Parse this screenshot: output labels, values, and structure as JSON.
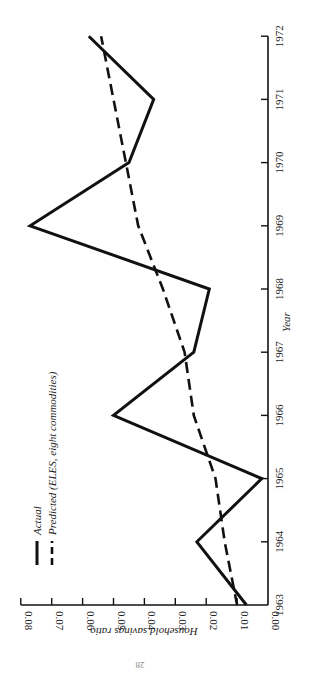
{
  "chart_data": {
    "type": "line",
    "title": "",
    "xlabel": "Year",
    "ylabel": "Household savings ratio",
    "orientation": "rotated 90° counter-clockwise (years run bottom-to-top on right edge; ratio increases right-to-left)",
    "x": [
      1963,
      1964,
      1965,
      1966,
      1967,
      1968,
      1969,
      1970,
      1971,
      1972
    ],
    "xticks": [
      "1963",
      "1964",
      "1965",
      "1966",
      "1967",
      "1968",
      "1969",
      "1970",
      "1971",
      "1972"
    ],
    "yticks": [
      "0.00",
      "0.01",
      "0.02",
      "0.03",
      "0.04",
      "0.05",
      "0.06",
      "0.07",
      "0.08"
    ],
    "ylim": [
      0,
      0.08
    ],
    "grid": false,
    "legend_position": "upper-left (rotated, near bottom-left of image)",
    "series": [
      {
        "name": "Actual",
        "style": "solid",
        "values": [
          0.007,
          0.023,
          0.002,
          0.05,
          0.024,
          0.019,
          0.077,
          0.045,
          0.037,
          0.058
        ]
      },
      {
        "name": "Predicted (ELES, eight commodities)",
        "style": "dashed",
        "values": [
          0.01,
          0.014,
          0.017,
          0.024,
          0.027,
          0.034,
          0.042,
          0.046,
          0.05,
          0.054
        ]
      }
    ]
  },
  "page": {
    "page_number": "28"
  }
}
